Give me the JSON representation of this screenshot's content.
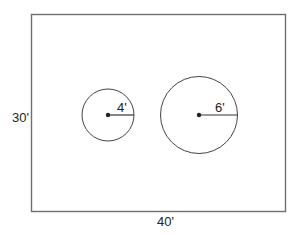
{
  "diagram": {
    "type": "floor-plan",
    "room": {
      "width_label": "40'",
      "height_label": "30'",
      "stroke_color": "#6f6f6f"
    },
    "circles": [
      {
        "id": "small",
        "radius_label": "4'",
        "stroke_color": "#444444"
      },
      {
        "id": "large",
        "radius_label": "6'",
        "stroke_color": "#444444"
      }
    ]
  }
}
